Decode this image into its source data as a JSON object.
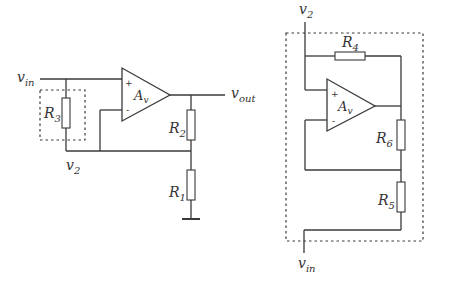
{
  "left_circuit": {
    "input_label": {
      "main": "v",
      "sub": "in"
    },
    "output_label": {
      "main": "v",
      "sub": "out"
    },
    "node_label": {
      "main": "v",
      "sub": "2"
    },
    "amplifier": {
      "main": "A",
      "sub": "v",
      "plus": "+",
      "minus": "-"
    },
    "resistors": {
      "r3": {
        "main": "R",
        "sub": "3"
      },
      "r2": {
        "main": "R",
        "sub": "2"
      },
      "r1": {
        "main": "R",
        "sub": "1"
      }
    }
  },
  "right_circuit": {
    "top_label": {
      "main": "v",
      "sub": "2"
    },
    "bottom_label": {
      "main": "v",
      "sub": "in"
    },
    "amplifier": {
      "main": "A",
      "sub": "v",
      "plus": "+",
      "minus": "-"
    },
    "resistors": {
      "r4": {
        "main": "R",
        "sub": "4"
      },
      "r6": {
        "main": "R",
        "sub": "6"
      },
      "r5": {
        "main": "R",
        "sub": "5"
      }
    }
  },
  "colors": {
    "line": "#3a3a3a",
    "background": "#ffffff"
  }
}
